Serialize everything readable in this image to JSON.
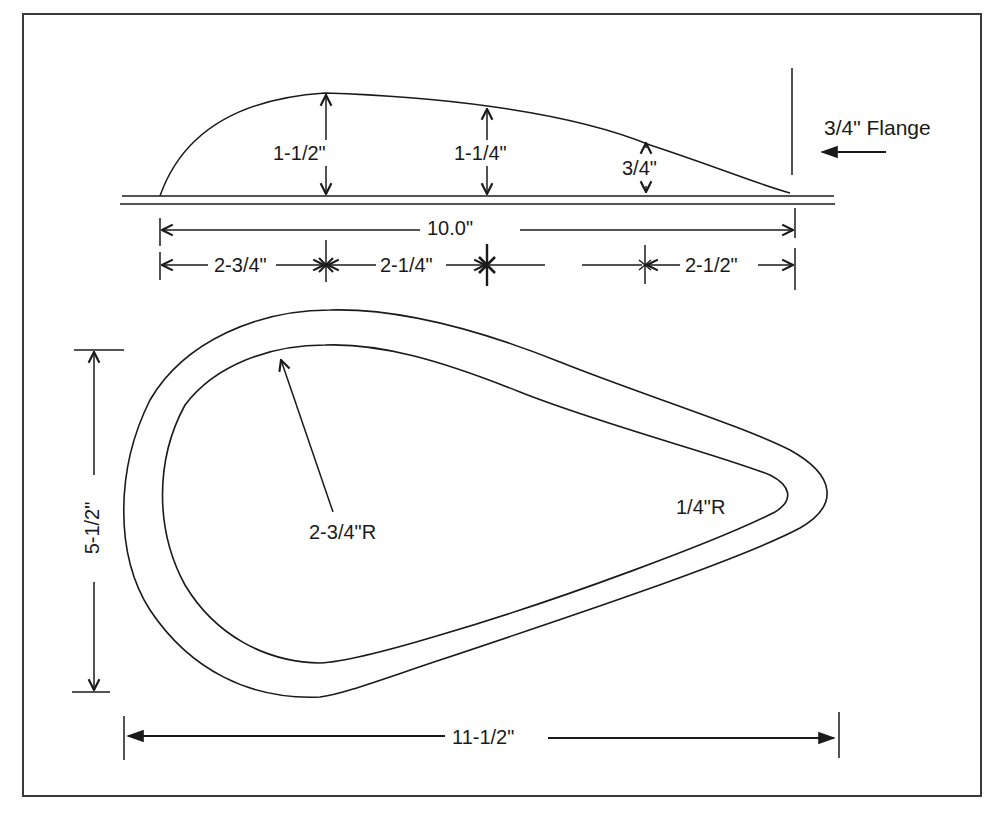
{
  "figure": {
    "type": "technical-drawing"
  },
  "profile_view": {
    "heights": [
      {
        "label": "1-1/2\"",
        "value_in": 1.5
      },
      {
        "label": "1-1/4\"",
        "value_in": 1.25
      },
      {
        "label": "3/4\"",
        "value_in": 0.75
      }
    ],
    "flange_label": "3/4\" Flange",
    "overall_length": {
      "label": "10.0\"",
      "value_in": 10.0
    },
    "segments": [
      {
        "label": "2-3/4\"",
        "value_in": 2.75
      },
      {
        "label": "2-1/4\"",
        "value_in": 2.25
      },
      {
        "label": "2-1/2\"",
        "value_in": 2.5
      }
    ]
  },
  "plan_view": {
    "large_radius": {
      "label": "2-3/4\"R",
      "value_in": 2.75
    },
    "small_radius": {
      "label": "1/4\"R",
      "value_in": 0.25
    },
    "width": {
      "label": "5-1/2\"",
      "value_in": 5.5
    },
    "length": {
      "label": "11-1/2\"",
      "value_in": 11.5
    }
  },
  "caption": ""
}
